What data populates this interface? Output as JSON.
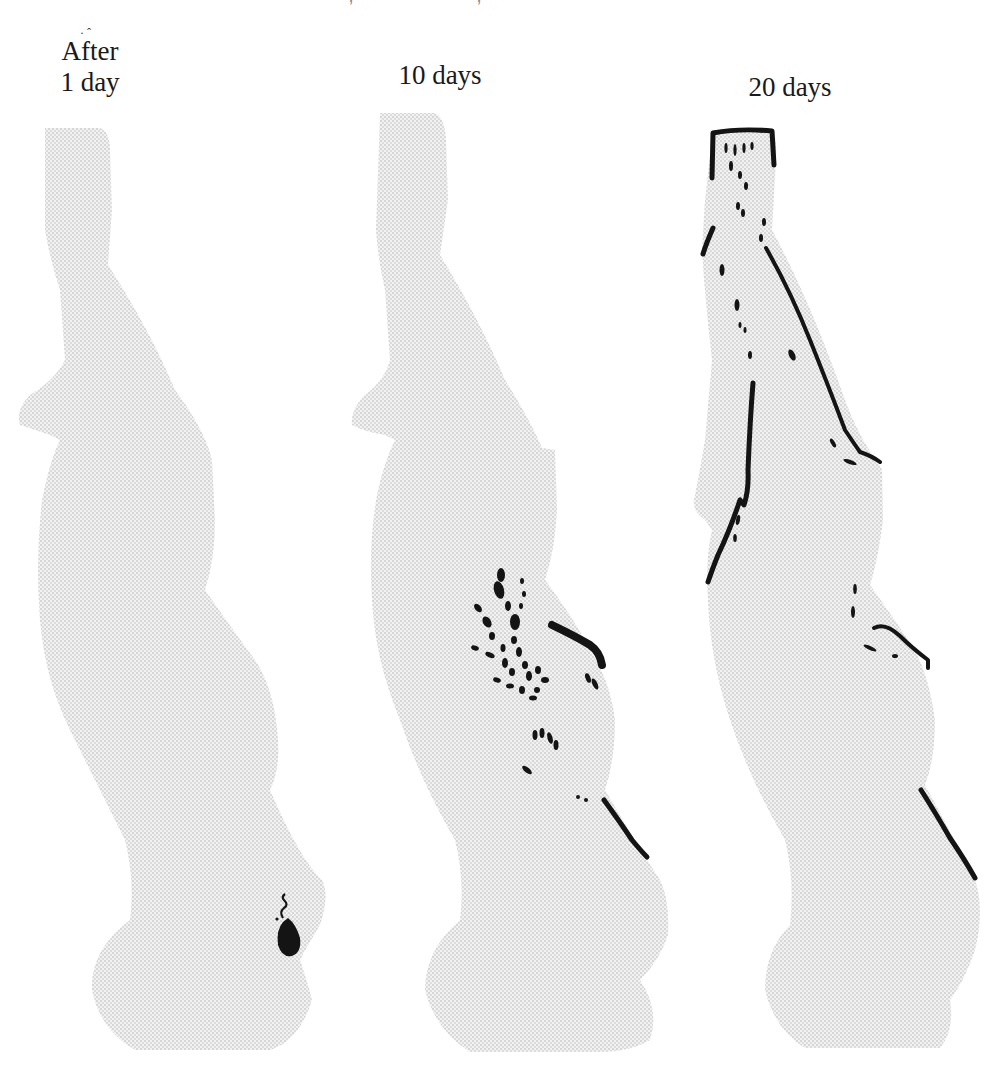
{
  "page": {
    "running_header_visible": "partially clipped (illegible)"
  },
  "figure": {
    "panels": [
      {
        "id": "panel-1",
        "label_lines": [
          "After",
          "1 day"
        ],
        "description": "Stippled silhouette with a single dark lesion near the lower right"
      },
      {
        "id": "panel-2",
        "label_lines": [
          "10 days"
        ],
        "description": "Stippled silhouette with clustered dark spots mid-body and streaks along the right edge"
      },
      {
        "id": "panel-3",
        "label_lines": [
          "20 days"
        ],
        "description": "Stippled silhouette with dark outlines along top, left and right edges plus scattered dashes"
      }
    ],
    "colors": {
      "stipple": "#e6e6e6",
      "mark": "#141414",
      "background": "#ffffff"
    }
  }
}
